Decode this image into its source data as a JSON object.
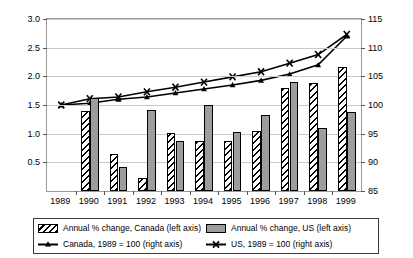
{
  "chart_data": {
    "type": "bar",
    "title": "",
    "categories": [
      "1989",
      "1990",
      "1991",
      "1992",
      "1993",
      "1994",
      "1995",
      "1996",
      "1997",
      "1998",
      "1999"
    ],
    "xlabel": "",
    "ylabel": "Annual % rate of change",
    "ylabel_right": "",
    "ylim": [
      0,
      3.0
    ],
    "yticks": [
      "3.0",
      "2.5",
      "2.0",
      "1.5",
      "1.0",
      "0.5"
    ],
    "ylim_right": [
      85,
      115
    ],
    "yticks_right": [
      "115",
      "110",
      "105",
      "100",
      "95",
      "90",
      "85"
    ],
    "grid": true,
    "legend_position": "bottom",
    "series": [
      {
        "name": "Annual % change, Canada (left axis)",
        "axis": "left",
        "kind": "bar",
        "fill": "hatched",
        "values": [
          null,
          1.4,
          0.65,
          0.22,
          1.01,
          0.87,
          0.87,
          1.04,
          1.8,
          1.88,
          2.16
        ]
      },
      {
        "name": "Annual % change, US (left axis)",
        "axis": "left",
        "kind": "bar",
        "fill": "solid-gray",
        "values": [
          null,
          1.63,
          0.42,
          1.42,
          0.87,
          1.5,
          1.03,
          1.32,
          1.9,
          1.1,
          1.38
        ]
      },
      {
        "name": "Canada, 1989 = 100 (right axis)",
        "axis": "right",
        "kind": "line",
        "marker": "triangle",
        "values": [
          100.0,
          100.3,
          101.0,
          101.4,
          102.1,
          102.8,
          103.5,
          104.3,
          105.4,
          107.0,
          112.0
        ]
      },
      {
        "name": "US, 1989 = 100 (right axis)",
        "axis": "right",
        "kind": "line",
        "marker": "cross",
        "values": [
          100.0,
          101.1,
          101.4,
          102.3,
          103.1,
          104.0,
          104.9,
          105.8,
          107.3,
          108.8,
          112.3
        ]
      }
    ]
  },
  "legend": {
    "items": [
      {
        "label": "Annual % change, Canada (left axis)",
        "swatch": "hatched-bar"
      },
      {
        "label": "Annual % change, US (left axis)",
        "swatch": "gray-bar"
      },
      {
        "label": "Canada, 1989 = 100 (right axis)",
        "swatch": "line-triangle"
      },
      {
        "label": "US, 1989 = 100 (right axis)",
        "swatch": "line-cross"
      }
    ]
  }
}
